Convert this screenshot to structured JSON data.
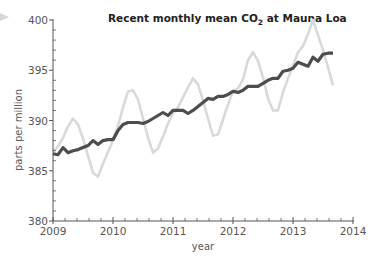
{
  "chart_data": {
    "type": "line",
    "title": "Recent monthly mean CO2 at Mauna Loa",
    "title_parts": {
      "pre": "Recent monthly mean CO",
      "sub": "2",
      "post": " at Mauna Loa"
    },
    "xlabel": "year",
    "ylabel": "parts per million",
    "xlim": [
      2009,
      2014
    ],
    "ylim": [
      380,
      400
    ],
    "x_ticks": [
      "2009",
      "2010",
      "2011",
      "2012",
      "2013",
      "2014"
    ],
    "y_ticks": [
      "380",
      "385",
      "390",
      "395",
      "400"
    ],
    "x_minor_ticks_per_year": 5,
    "y_minor_ticks_per_major": 5,
    "grid": false,
    "legend": null,
    "x_start": 2009.0,
    "x_step_months": 1,
    "series": [
      {
        "name": "monthly mean (seasonal)",
        "color": "#d9d9d9",
        "values": [
          386.9,
          387.4,
          388.3,
          389.4,
          390.2,
          389.6,
          388.2,
          386.5,
          384.8,
          384.4,
          385.7,
          386.9,
          388.0,
          389.5,
          391.3,
          392.9,
          393.0,
          392.1,
          390.2,
          388.3,
          386.8,
          387.2,
          388.4,
          389.7,
          390.7,
          391.3,
          392.3,
          393.3,
          394.2,
          393.6,
          392.0,
          390.2,
          388.5,
          388.6,
          390.1,
          391.6,
          392.9,
          393.2,
          394.1,
          396.0,
          396.8,
          395.9,
          394.3,
          392.2,
          391.0,
          391.0,
          392.8,
          394.2,
          395.5,
          396.8,
          397.4,
          398.6,
          400.0,
          398.5,
          397.0,
          395.3,
          393.5
        ]
      },
      {
        "name": "seasonally adjusted trend",
        "color": "#4d4d4d",
        "values": [
          386.7,
          386.6,
          387.3,
          386.8,
          387.0,
          387.1,
          387.3,
          387.5,
          388.0,
          387.6,
          388.0,
          388.1,
          388.1,
          389.0,
          389.6,
          389.8,
          389.8,
          389.8,
          389.7,
          389.9,
          390.2,
          390.5,
          390.8,
          390.5,
          391.0,
          391.0,
          391.0,
          390.7,
          391.0,
          391.4,
          391.8,
          392.2,
          392.1,
          392.4,
          392.4,
          392.6,
          392.9,
          392.8,
          393.0,
          393.4,
          393.4,
          393.4,
          393.7,
          394.0,
          394.2,
          394.2,
          394.9,
          395.0,
          395.2,
          395.8,
          395.6,
          395.4,
          396.3,
          395.9,
          396.6,
          396.7,
          396.7
        ]
      }
    ]
  },
  "decor": {
    "corner_arrow_color": "#d6d6d6"
  }
}
